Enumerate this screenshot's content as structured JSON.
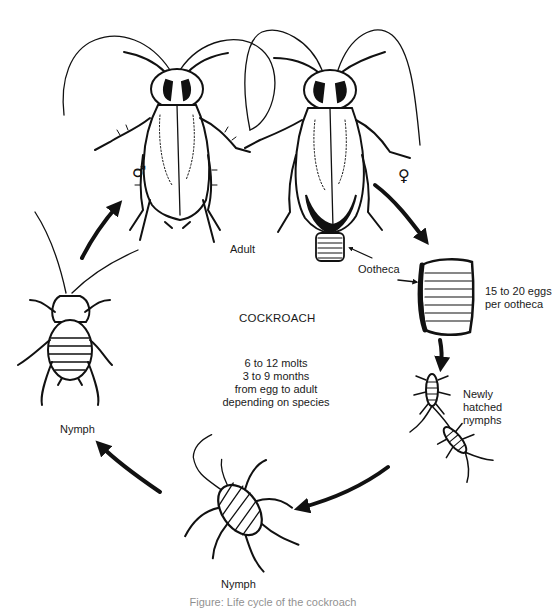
{
  "diagram": {
    "title": "COCKROACH",
    "type": "life-cycle",
    "center_note": {
      "lines": [
        "6 to 12 molts",
        "3 to 9 months",
        "from egg to adult",
        "depending on species"
      ]
    },
    "stages": [
      {
        "id": "adult",
        "label": "Adult"
      },
      {
        "id": "ootheca",
        "label": "Ootheca"
      },
      {
        "id": "eggs",
        "lines": [
          "15 to 20 eggs",
          "per ootheca"
        ]
      },
      {
        "id": "newly_hatched",
        "lines": [
          "Newly",
          "hatched",
          "nymphs"
        ]
      },
      {
        "id": "nymph_bottom",
        "label": "Nymph"
      },
      {
        "id": "nymph_left",
        "label": "Nymph"
      }
    ],
    "symbols": {
      "male": "♂",
      "female": "♀"
    },
    "caption": "Figure: Life cycle of the cockroach"
  },
  "colors": {
    "ink": "#111111",
    "background": "#ffffff"
  }
}
